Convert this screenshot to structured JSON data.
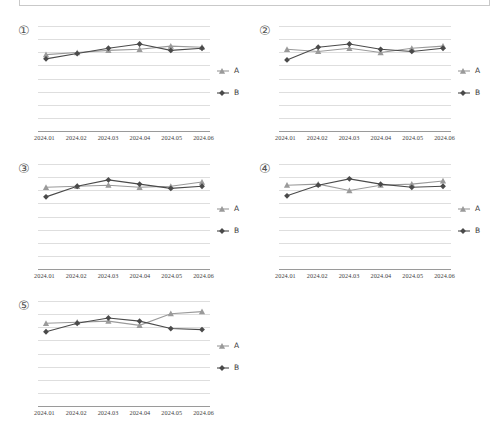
{
  "header": {
    "box_label": ""
  },
  "panels": [
    {
      "index_label": "①",
      "legend": [
        {
          "name": "A",
          "marker": "triangle-marker",
          "color": "#9a9a9a"
        },
        {
          "name": "B",
          "marker": "diamond-marker",
          "color": "#4a4a4a"
        }
      ],
      "chart_data": {
        "type": "line",
        "title": "①",
        "xlabel": "",
        "ylabel": "",
        "x": [
          "2024.01",
          "2024.02",
          "2024.03",
          "2024.04",
          "2024.05",
          "2024.06"
        ],
        "ylim": [
          0,
          10
        ],
        "grid": true,
        "legend_position": "right",
        "series": [
          {
            "name": "A",
            "color": "#9a9a9a",
            "marker": "triangle",
            "values": [
              7.3,
              7.5,
              7.7,
              7.8,
              8.1,
              8.0
            ]
          },
          {
            "name": "B",
            "color": "#4a4a4a",
            "marker": "diamond",
            "values": [
              6.9,
              7.4,
              7.9,
              8.3,
              7.7,
              7.9
            ]
          }
        ]
      }
    },
    {
      "index_label": "②",
      "legend": [
        {
          "name": "A",
          "marker": "triangle-marker",
          "color": "#9a9a9a"
        },
        {
          "name": "B",
          "marker": "diamond-marker",
          "color": "#4a4a4a"
        }
      ],
      "chart_data": {
        "type": "line",
        "title": "②",
        "xlabel": "",
        "ylabel": "",
        "x": [
          "2024.01",
          "2024.02",
          "2024.03",
          "2024.04",
          "2024.05",
          "2024.06"
        ],
        "ylim": [
          0,
          10
        ],
        "grid": true,
        "legend_position": "right",
        "series": [
          {
            "name": "A",
            "color": "#9a9a9a",
            "marker": "triangle",
            "values": [
              7.8,
              7.6,
              7.9,
              7.5,
              7.9,
              8.1
            ]
          },
          {
            "name": "B",
            "color": "#4a4a4a",
            "marker": "diamond",
            "values": [
              6.8,
              8.0,
              8.3,
              7.8,
              7.6,
              7.9
            ]
          }
        ]
      }
    },
    {
      "index_label": "③",
      "legend": [
        {
          "name": "A",
          "marker": "triangle-marker",
          "color": "#9a9a9a"
        },
        {
          "name": "B",
          "marker": "diamond-marker",
          "color": "#4a4a4a"
        }
      ],
      "chart_data": {
        "type": "line",
        "title": "③",
        "xlabel": "",
        "ylabel": "",
        "x": [
          "2024.01",
          "2024.02",
          "2024.03",
          "2024.04",
          "2024.05",
          "2024.06"
        ],
        "ylim": [
          0,
          10
        ],
        "grid": true,
        "legend_position": "right",
        "series": [
          {
            "name": "A",
            "color": "#9a9a9a",
            "marker": "triangle",
            "values": [
              7.8,
              7.9,
              8.0,
              7.8,
              7.9,
              8.3
            ]
          },
          {
            "name": "B",
            "color": "#4a4a4a",
            "marker": "diamond",
            "values": [
              6.9,
              7.9,
              8.5,
              8.1,
              7.7,
              7.9
            ]
          }
        ]
      }
    },
    {
      "index_label": "④",
      "legend": [
        {
          "name": "A",
          "marker": "triangle-marker",
          "color": "#9a9a9a"
        },
        {
          "name": "B",
          "marker": "diamond-marker",
          "color": "#4a4a4a"
        }
      ],
      "chart_data": {
        "type": "line",
        "title": "④",
        "xlabel": "",
        "ylabel": "",
        "x": [
          "2024.01",
          "2024.02",
          "2024.03",
          "2024.04",
          "2024.05",
          "2024.06"
        ],
        "ylim": [
          0,
          10
        ],
        "grid": true,
        "legend_position": "right",
        "series": [
          {
            "name": "A",
            "color": "#9a9a9a",
            "marker": "triangle",
            "values": [
              8.0,
              8.1,
              7.5,
              8.0,
              8.1,
              8.4
            ]
          },
          {
            "name": "B",
            "color": "#4a4a4a",
            "marker": "diamond",
            "values": [
              7.0,
              8.0,
              8.6,
              8.1,
              7.8,
              7.9
            ]
          }
        ]
      }
    },
    {
      "index_label": "⑤",
      "legend": [
        {
          "name": "A",
          "marker": "triangle-marker",
          "color": "#9a9a9a"
        },
        {
          "name": "B",
          "marker": "diamond-marker",
          "color": "#4a4a4a"
        }
      ],
      "chart_data": {
        "type": "line",
        "title": "⑤",
        "xlabel": "",
        "ylabel": "",
        "x": [
          "2024.01",
          "2024.02",
          "2024.03",
          "2024.04",
          "2024.05",
          "2024.06"
        ],
        "ylim": [
          0,
          10
        ],
        "grid": true,
        "legend_position": "right",
        "series": [
          {
            "name": "A",
            "color": "#9a9a9a",
            "marker": "triangle",
            "values": [
              7.9,
              8.0,
              8.1,
              7.7,
              8.8,
              9.0
            ]
          },
          {
            "name": "B",
            "color": "#4a4a4a",
            "marker": "diamond",
            "values": [
              7.1,
              7.9,
              8.4,
              8.1,
              7.4,
              7.3
            ]
          }
        ]
      }
    }
  ],
  "layout": {
    "gridline_count": 9,
    "panel_positions": [
      {
        "left": 14,
        "top": 22
      },
      {
        "left": 255,
        "top": 22
      },
      {
        "left": 14,
        "top": 160
      },
      {
        "left": 255,
        "top": 160
      },
      {
        "left": 14,
        "top": 297
      }
    ]
  },
  "colors": {
    "series_a": "#9a9a9a",
    "series_b": "#4a4a4a",
    "gridline": "#dedede",
    "axis": "#9a9a9a",
    "border": "#c9c9c9",
    "text": "#3a3a3a"
  }
}
